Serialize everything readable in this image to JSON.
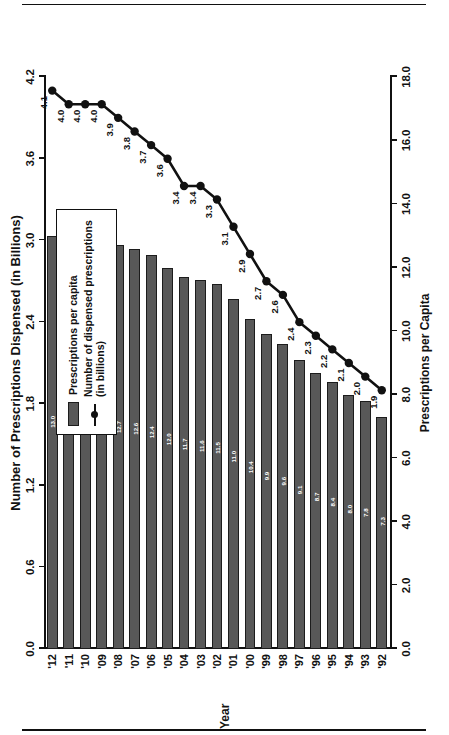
{
  "chart_data": {
    "type": "bar",
    "title": "Number of Prescriptions Dispensed (in Billions)",
    "categories": [
      "'92",
      "'93",
      "'94",
      "'95",
      "'96",
      "'97",
      "'98",
      "'99",
      "'00",
      "'01",
      "'02",
      "'03",
      "'04",
      "'05",
      "'06",
      "'07",
      "'08",
      "'09",
      "'10",
      "'11",
      "'12"
    ],
    "xlabel": "Year",
    "ylabel": "Prescriptions per Capita",
    "secondary_ylabel": "Number of Prescriptions Dispensed (in Billions)",
    "ylim": [
      0,
      18
    ],
    "yticks": [
      "0.0",
      "2.0",
      "4.0",
      "6.0",
      "8.0",
      "10.0",
      "12.0",
      "14.0",
      "16.0",
      "18.0"
    ],
    "secondary_ylim": [
      0,
      4.2
    ],
    "secondary_yticks": [
      "0.0",
      "0.6",
      "1.2",
      "1.8",
      "2.4",
      "3.0",
      "3.6",
      "4.2"
    ],
    "grid": false,
    "legend_position": "inside-left",
    "series": [
      {
        "name": "Prescriptions per capita",
        "kind": "bar",
        "axis": "primary",
        "color": "#585858",
        "values": [
          7.3,
          7.8,
          8.0,
          8.4,
          8.7,
          9.1,
          9.6,
          9.9,
          10.4,
          11.0,
          11.5,
          11.6,
          11.7,
          12.0,
          12.4,
          12.6,
          12.7,
          12.9,
          12.9,
          12.9,
          13.0
        ],
        "labels": [
          "7.3",
          "7.8",
          "8.0",
          "8.4",
          "8.7",
          "9.1",
          "9.6",
          "9.9",
          "10.4",
          "11.0",
          "11.5",
          "11.6",
          "11.7",
          "12.0",
          "12.4",
          "12.6",
          "12.7",
          "12.9",
          "12.9",
          "12.9",
          "13.0"
        ]
      },
      {
        "name": "Number of dispensed prescriptions (in billions)",
        "kind": "line",
        "axis": "secondary",
        "color": "#111111",
        "values": [
          1.9,
          2.0,
          2.1,
          2.2,
          2.3,
          2.4,
          2.6,
          2.7,
          2.9,
          3.1,
          3.3,
          3.4,
          3.4,
          3.6,
          3.7,
          3.8,
          3.9,
          4.0,
          4.0,
          4.0,
          4.1
        ],
        "labels": [
          "1.9",
          "2.0",
          "2.1",
          "2.2",
          "2.3",
          "2.4",
          "2.6",
          "2.7",
          "2.9",
          "3.1",
          "3.3",
          "3.4",
          "3.4",
          "3.6",
          "3.7",
          "3.8",
          "3.9",
          "4.0",
          "4.0",
          "4.0",
          "4.1"
        ]
      }
    ]
  },
  "legend": {
    "items": [
      {
        "label": "Prescriptions per capita",
        "marker": "swatch"
      },
      {
        "label": "Number of dispensed prescriptions\n(in billions)",
        "marker": "line-dot"
      }
    ]
  },
  "colors": {
    "bar_fill": "#585858",
    "bar_stroke": "#1c1c1c",
    "line": "#111111",
    "text": "#111111",
    "background": "#ffffff"
  }
}
